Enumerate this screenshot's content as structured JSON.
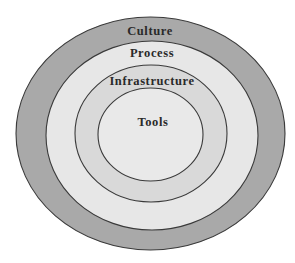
{
  "diagram": {
    "type": "concentric-ellipses",
    "stroke_color": "#3a3a3a",
    "layers": [
      {
        "label": "Culture",
        "fill": "#a9a9a9",
        "ellipse": {
          "cx": 150.5,
          "cy": 133.5,
          "rx": 134.5,
          "ry": 116.5
        },
        "label_pos": {
          "x": 150,
          "y": 35
        }
      },
      {
        "label": "Process",
        "fill": "#e7e7e7",
        "ellipse": {
          "cx": 152,
          "cy": 135.5,
          "rx": 106,
          "ry": 94.5
        },
        "label_pos": {
          "x": 152,
          "y": 57
        }
      },
      {
        "label": "Infrastructure",
        "fill": "#d9d9d9",
        "ellipse": {
          "cx": 151,
          "cy": 133.5,
          "rx": 76,
          "ry": 68.5
        },
        "label_pos": {
          "x": 152,
          "y": 85
        }
      },
      {
        "label": "Tools",
        "fill": "#e9e9e9",
        "ellipse": {
          "cx": 150.5,
          "cy": 134.5,
          "rx": 52.5,
          "ry": 46.5
        },
        "label_pos": {
          "x": 153,
          "y": 126
        }
      }
    ]
  }
}
